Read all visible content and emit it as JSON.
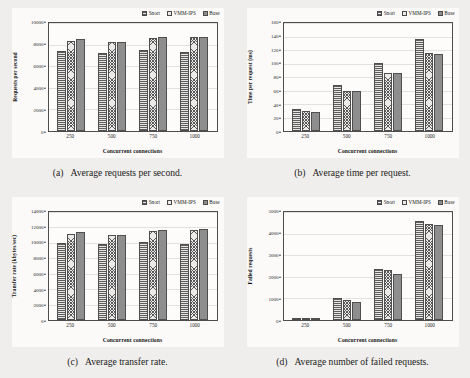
{
  "figure": {
    "legend": [
      {
        "name": "Snort",
        "pattern": "horizontal-lines"
      },
      {
        "name": "VMM-IPS",
        "pattern": "diagonal-crosshatch"
      },
      {
        "name": "Base",
        "pattern": "solid-gray"
      }
    ],
    "colors": {
      "page_background": "#f0eeec",
      "plot_background": "#fdfcfb",
      "axis_line": "#4d4d4d",
      "gridline": "#e3e1df",
      "snort_fill": "#e8e6e4",
      "vmm_ips_fill": "#eceae8",
      "base_fill": "#8e8e8e",
      "hatch_stroke": "#585858"
    },
    "panels": [
      {
        "label": "(a)",
        "text": "Average requests per second."
      },
      {
        "label": "(b)",
        "text": "Average time per request."
      },
      {
        "label": "(c)",
        "text": "Average transfer rate."
      },
      {
        "label": "(d)",
        "text": "Average number of failed requests."
      }
    ]
  },
  "chart_data": [
    {
      "type": "bar",
      "panel": "a",
      "title": "Average requests per second.",
      "xlabel": "Concurrent connections",
      "ylabel": "Requests per second",
      "categories": [
        "250",
        "500",
        "750",
        "1000"
      ],
      "ylim": [
        0,
        10000
      ],
      "yticks": [
        0,
        2000,
        4000,
        6000,
        8000,
        10000
      ],
      "ytick_labels": [
        "0",
        "2000",
        "4000",
        "6000",
        "8000",
        "10000"
      ],
      "grid": true,
      "legend_position": "top-right",
      "series": [
        {
          "name": "Snort",
          "values": [
            7400,
            7200,
            7500,
            7300
          ]
        },
        {
          "name": "VMM-IPS",
          "values": [
            8300,
            8200,
            8600,
            8700
          ]
        },
        {
          "name": "Base",
          "values": [
            8500,
            8200,
            8700,
            8750
          ]
        }
      ]
    },
    {
      "type": "bar",
      "panel": "b",
      "title": "Average time per request.",
      "xlabel": "Concurrent connections",
      "ylabel": "Time per request (ms)",
      "categories": [
        "250",
        "500",
        "750",
        "1000"
      ],
      "ylim": [
        0,
        160
      ],
      "yticks": [
        0,
        20,
        40,
        60,
        80,
        100,
        120,
        140,
        160
      ],
      "ytick_labels": [
        "0",
        "20",
        "40",
        "60",
        "80",
        "100",
        "120",
        "140",
        "160"
      ],
      "grid": true,
      "legend_position": "top-right",
      "series": [
        {
          "name": "Snort",
          "values": [
            33,
            68,
            101,
            137
          ]
        },
        {
          "name": "VMM-IPS",
          "values": [
            29,
            60,
            86,
            115
          ]
        },
        {
          "name": "Base",
          "values": [
            28,
            60,
            86,
            114
          ]
        }
      ]
    },
    {
      "type": "bar",
      "panel": "c",
      "title": "Average transfer rate.",
      "xlabel": "Concurrent connections",
      "ylabel": "Transfer rate (kbytes/sec)",
      "categories": [
        "250",
        "500",
        "750",
        "1000"
      ],
      "ylim": [
        0,
        14000
      ],
      "yticks": [
        0,
        2000,
        4000,
        6000,
        8000,
        10000,
        12000,
        14000
      ],
      "ytick_labels": [
        "0",
        "2000",
        "4000",
        "6000",
        "8000",
        "10000",
        "12000",
        "14000"
      ],
      "grid": true,
      "legend_position": "top-right",
      "series": [
        {
          "name": "Snort",
          "values": [
            10000,
            9850,
            10100,
            9850
          ]
        },
        {
          "name": "VMM-IPS",
          "values": [
            11150,
            11050,
            11500,
            11650
          ]
        },
        {
          "name": "Base",
          "values": [
            11350,
            11050,
            11700,
            11750
          ]
        }
      ]
    },
    {
      "type": "bar",
      "panel": "d",
      "title": "Average number of failed requests.",
      "xlabel": "Concurrent connections",
      "ylabel": "Failed requests",
      "categories": [
        "250",
        "500",
        "750",
        "1000"
      ],
      "ylim": [
        0,
        5000
      ],
      "yticks": [
        0,
        1000,
        2000,
        3000,
        4000,
        5000
      ],
      "ytick_labels": [
        "0",
        "1000",
        "2000",
        "3000",
        "4000",
        "5000"
      ],
      "grid": true,
      "legend_position": "top-right",
      "series": [
        {
          "name": "Snort",
          "values": [
            20,
            1000,
            2350,
            4600
          ]
        },
        {
          "name": "VMM-IPS",
          "values": [
            15,
            910,
            2300,
            4450
          ]
        },
        {
          "name": "Base",
          "values": [
            10,
            830,
            2120,
            4380
          ]
        }
      ]
    }
  ]
}
